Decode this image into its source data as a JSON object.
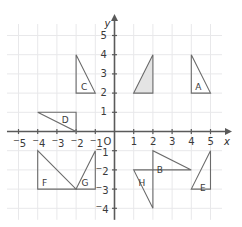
{
  "figure": {
    "kind": "coordinate-plane-with-triangles",
    "axis_labels": {
      "x": "x",
      "y": "y",
      "origin": "O"
    },
    "grid": {
      "visible": true,
      "color": "#e8e8ea",
      "spacing_units": 1
    },
    "axis_color": "#5a5a5a",
    "shape_stroke": "#6b6b6b",
    "shape_fill_shaded": "#e4e4e4",
    "shape_fill_plain": "none",
    "x_range": [
      -5.6,
      5.6
    ],
    "y_range": [
      -4.6,
      5.6
    ],
    "x_ticks": [
      {
        "value": -5,
        "label": "-5"
      },
      {
        "value": -4,
        "label": "-4"
      },
      {
        "value": -3,
        "label": "-3"
      },
      {
        "value": -2,
        "label": "-2"
      },
      {
        "value": -1,
        "label": "-1"
      },
      {
        "value": 1,
        "label": "1"
      },
      {
        "value": 2,
        "label": "2"
      },
      {
        "value": 3,
        "label": "3"
      },
      {
        "value": 4,
        "label": "4"
      },
      {
        "value": 5,
        "label": "5"
      }
    ],
    "y_ticks": [
      {
        "value": 5,
        "label": "5"
      },
      {
        "value": 4,
        "label": "4"
      },
      {
        "value": 3,
        "label": "3"
      },
      {
        "value": 2,
        "label": "2"
      },
      {
        "value": 1,
        "label": "1"
      },
      {
        "value": -1,
        "label": "-1"
      },
      {
        "value": -2,
        "label": "-2"
      },
      {
        "value": -3,
        "label": "-3"
      },
      {
        "value": -4,
        "label": "-4"
      }
    ],
    "shapes": [
      {
        "id": "triangle-c",
        "label": "C",
        "label_at": [
          -1.75,
          2.55
        ],
        "shaded": false,
        "vertices": [
          [
            -2,
            4
          ],
          [
            -2,
            2
          ],
          [
            -1,
            2
          ]
        ]
      },
      {
        "id": "triangle-shaded",
        "label": "",
        "label_at": null,
        "shaded": true,
        "vertices": [
          [
            1,
            2
          ],
          [
            2,
            4
          ],
          [
            2,
            2
          ]
        ]
      },
      {
        "id": "triangle-a",
        "label": "A",
        "label_at": [
          4.2,
          2.55
        ],
        "shaded": false,
        "vertices": [
          [
            4,
            4
          ],
          [
            4,
            2
          ],
          [
            5,
            2
          ]
        ]
      },
      {
        "id": "triangle-d",
        "label": "D",
        "label_at": [
          -2.75,
          0.82
        ],
        "shaded": false,
        "vertices": [
          [
            -4,
            1
          ],
          [
            -2,
            1
          ],
          [
            -2,
            0
          ]
        ]
      },
      {
        "id": "triangle-f",
        "label": "F",
        "label_at": [
          -3.78,
          -2.45
        ],
        "shaded": false,
        "vertices": [
          [
            -4,
            -1
          ],
          [
            -4,
            -3
          ],
          [
            -2,
            -3
          ]
        ]
      },
      {
        "id": "triangle-g",
        "label": "G",
        "label_at": [
          -1.72,
          -2.45
        ],
        "shaded": false,
        "vertices": [
          [
            -2,
            -3
          ],
          [
            -1,
            -1
          ],
          [
            -1,
            -3
          ]
        ]
      },
      {
        "id": "triangle-b",
        "label": "B",
        "label_at": [
          2.2,
          -1.78
        ],
        "shaded": false,
        "vertices": [
          [
            2,
            -1
          ],
          [
            2,
            -2
          ],
          [
            4,
            -2
          ]
        ]
      },
      {
        "id": "triangle-h",
        "label": "H",
        "label_at": [
          1.25,
          -2.45
        ],
        "shaded": false,
        "vertices": [
          [
            1,
            -2
          ],
          [
            2,
            -2
          ],
          [
            2,
            -4
          ]
        ]
      },
      {
        "id": "triangle-e",
        "label": "E",
        "label_at": [
          4.45,
          -2.75
        ],
        "shaded": false,
        "vertices": [
          [
            5,
            -1
          ],
          [
            4,
            -3
          ],
          [
            5,
            -3
          ]
        ]
      }
    ]
  }
}
